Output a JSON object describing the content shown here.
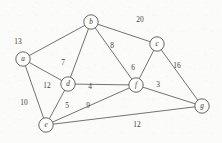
{
  "figure": {
    "type": "weighted-undirected-graph",
    "background_color": "#fbfbf9",
    "line_color": "#5a5a58",
    "text_color": "#3d3d36",
    "width": 222,
    "height": 143
  },
  "chart_data": {
    "type": "diagram",
    "title": "",
    "nodes": [
      {
        "id": "a",
        "label": "a",
        "x": 23,
        "y": 59,
        "r": 7.2
      },
      {
        "id": "b",
        "label": "b",
        "x": 91,
        "y": 22,
        "r": 7.2
      },
      {
        "id": "c",
        "label": "c",
        "x": 157,
        "y": 44,
        "r": 7.2
      },
      {
        "id": "d",
        "label": "d",
        "x": 68,
        "y": 84,
        "r": 7.2
      },
      {
        "id": "e",
        "label": "e",
        "x": 46,
        "y": 125,
        "r": 7.2
      },
      {
        "id": "f",
        "label": "f",
        "x": 136,
        "y": 85,
        "r": 7.2
      },
      {
        "id": "g",
        "label": "g",
        "x": 202,
        "y": 106,
        "r": 7.2
      }
    ],
    "edges": [
      {
        "source": "a",
        "target": "b",
        "weight": "13",
        "lx": 18,
        "ly": 41
      },
      {
        "source": "b",
        "target": "c",
        "weight": "20",
        "lx": 140,
        "ly": 19
      },
      {
        "source": "b",
        "target": "d",
        "weight": "7",
        "lx": 63,
        "ly": 62
      },
      {
        "source": "b",
        "target": "f",
        "weight": "8",
        "lx": 112,
        "ly": 45
      },
      {
        "source": "c",
        "target": "f",
        "weight": "6",
        "lx": 133,
        "ly": 67
      },
      {
        "source": "c",
        "target": "g",
        "weight": "16",
        "lx": 177,
        "ly": 65
      },
      {
        "source": "a",
        "target": "d",
        "weight": "12",
        "lx": 47,
        "ly": 85
      },
      {
        "source": "a",
        "target": "e",
        "weight": "10",
        "lx": 24,
        "ly": 102
      },
      {
        "source": "d",
        "target": "f",
        "weight": "4",
        "lx": 90,
        "ly": 86
      },
      {
        "source": "d",
        "target": "e",
        "weight": "5",
        "lx": 67,
        "ly": 105
      },
      {
        "source": "e",
        "target": "f",
        "weight": "9",
        "lx": 88,
        "ly": 105
      },
      {
        "source": "f",
        "target": "g",
        "weight": "3",
        "lx": 158,
        "ly": 84
      },
      {
        "source": "e",
        "target": "g",
        "weight": "12",
        "lx": 137,
        "ly": 124
      }
    ]
  }
}
